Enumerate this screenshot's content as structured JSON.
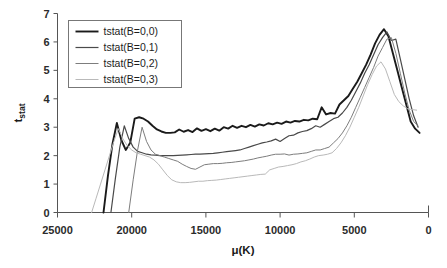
{
  "chart_data": {
    "type": "line",
    "title": "",
    "xlabel": "μ(K)",
    "ylabel": "t",
    "ylabel_sub": "stat",
    "xlim": [
      25000,
      0
    ],
    "ylim": [
      0,
      7
    ],
    "x_reversed": true,
    "grid": false,
    "legend_position": "top-left",
    "xticks": [
      25000,
      20000,
      15000,
      10000,
      5000,
      0
    ],
    "xtick_labels": [
      "25000",
      "20000",
      "15000",
      "10000",
      "5000",
      "0"
    ],
    "yticks": [
      0,
      1,
      2,
      3,
      4,
      5,
      6,
      7
    ],
    "ytick_labels": [
      "0",
      "1",
      "2",
      "3",
      "4",
      "5",
      "6",
      "7"
    ],
    "colors": {
      "series0": "#1a1a1a",
      "series1": "#4a4a4a",
      "series2": "#7d7d7d",
      "series3": "#b9b9b9"
    },
    "series": [
      {
        "name": "tstat(B=0,0)",
        "color": "#1a1a1a",
        "width": 1.9,
        "x": [
          21900,
          21600,
          21300,
          21000,
          20700,
          20400,
          20100,
          19800,
          19500,
          19200,
          18900,
          18600,
          18300,
          18000,
          17700,
          17400,
          17100,
          16800,
          16500,
          16200,
          15900,
          15600,
          15300,
          15000,
          14700,
          14400,
          14100,
          13800,
          13500,
          13200,
          12900,
          12600,
          12300,
          12000,
          11700,
          11400,
          11100,
          10800,
          10500,
          10200,
          9900,
          9600,
          9300,
          9000,
          8700,
          8400,
          8100,
          7800,
          7500,
          7200,
          6900,
          6600,
          6300,
          6000,
          5700,
          5400,
          5100,
          4800,
          4500,
          4200,
          3900,
          3600,
          3300,
          3000,
          2700,
          2400,
          2100,
          1800,
          1500,
          1200,
          900,
          600
        ],
        "y": [
          0.0,
          1.3,
          2.4,
          3.15,
          2.55,
          2.2,
          2.45,
          3.3,
          3.35,
          3.3,
          3.2,
          3.05,
          2.92,
          2.85,
          2.8,
          2.8,
          2.82,
          2.92,
          2.84,
          2.9,
          2.83,
          2.96,
          2.87,
          2.93,
          2.86,
          2.95,
          2.88,
          3.0,
          2.95,
          3.05,
          2.98,
          3.05,
          3.0,
          3.08,
          3.02,
          3.1,
          3.06,
          3.14,
          3.1,
          3.16,
          3.12,
          3.2,
          3.16,
          3.22,
          3.2,
          3.26,
          3.24,
          3.3,
          3.28,
          3.7,
          3.45,
          3.5,
          3.48,
          3.8,
          3.95,
          4.1,
          4.35,
          4.6,
          4.9,
          5.2,
          5.55,
          5.95,
          6.25,
          6.45,
          6.2,
          5.6,
          5.0,
          4.4,
          3.8,
          3.2,
          2.95,
          2.8
        ]
      },
      {
        "name": "tstat(B=0,1)",
        "color": "#4a4a4a",
        "width": 1.2,
        "x": [
          21400,
          21100,
          20800,
          20500,
          20200,
          19900,
          19600,
          19300,
          19000,
          18700,
          18400,
          18100,
          17800,
          17500,
          17200,
          16900,
          16600,
          16300,
          16000,
          15700,
          15400,
          15100,
          14800,
          14500,
          14200,
          13900,
          13600,
          13300,
          13000,
          12700,
          12400,
          12100,
          11800,
          11500,
          11200,
          10900,
          10600,
          10300,
          10000,
          9700,
          9400,
          9100,
          8800,
          8500,
          8200,
          7900,
          7600,
          7300,
          7000,
          6700,
          6400,
          6100,
          5800,
          5500,
          5200,
          4900,
          4600,
          4300,
          4000,
          3700,
          3400,
          3100,
          2800,
          2500,
          2200,
          1900,
          1600,
          1300,
          1000,
          700
        ],
        "y": [
          0.0,
          1.2,
          2.3,
          3.05,
          2.6,
          2.3,
          2.15,
          2.1,
          2.05,
          2.03,
          2.02,
          2.0,
          2.0,
          2.0,
          2.0,
          2.01,
          2.02,
          2.03,
          2.04,
          2.05,
          2.05,
          2.06,
          2.07,
          2.08,
          2.1,
          2.12,
          2.14,
          2.16,
          2.18,
          2.2,
          2.25,
          2.3,
          2.35,
          2.4,
          2.45,
          2.48,
          2.52,
          2.58,
          2.5,
          2.6,
          2.7,
          2.72,
          2.8,
          2.85,
          2.88,
          2.95,
          3.05,
          3.0,
          3.1,
          3.2,
          3.3,
          3.35,
          3.5,
          3.7,
          3.95,
          4.25,
          4.55,
          4.9,
          5.2,
          5.55,
          5.9,
          6.15,
          6.35,
          6.05,
          6.1,
          5.4,
          4.7,
          4.0,
          3.4,
          3.0
        ]
      },
      {
        "name": "tstat(B=0,2)",
        "color": "#7d7d7d",
        "width": 1.0,
        "x": [
          20200,
          19900,
          19600,
          19300,
          19000,
          18700,
          18400,
          18100,
          17800,
          17500,
          17200,
          16900,
          16600,
          16300,
          16000,
          15700,
          15400,
          15100,
          14800,
          14500,
          14200,
          13900,
          13600,
          13300,
          13000,
          12700,
          12400,
          12100,
          11800,
          11500,
          11200,
          10900,
          10600,
          10300,
          10000,
          9700,
          9400,
          9100,
          8800,
          8500,
          8200,
          7900,
          7600,
          7300,
          7000,
          6700,
          6400,
          6100,
          5800,
          5500,
          5200,
          4900,
          4600,
          4300,
          4000,
          3700,
          3400,
          3100,
          2800,
          2500,
          2200,
          1900,
          1600,
          1300,
          1000,
          700
        ],
        "y": [
          0.0,
          1.15,
          2.2,
          3.0,
          2.5,
          2.2,
          2.05,
          2.0,
          1.95,
          1.9,
          1.85,
          1.8,
          1.7,
          1.62,
          1.55,
          1.52,
          1.6,
          1.68,
          1.7,
          1.72,
          1.72,
          1.73,
          1.75,
          1.76,
          1.78,
          1.8,
          1.82,
          1.85,
          1.88,
          1.92,
          1.95,
          1.98,
          2.02,
          2.05,
          2.05,
          2.06,
          2.02,
          2.05,
          2.06,
          2.08,
          2.1,
          2.15,
          2.2,
          2.2,
          2.25,
          2.3,
          2.45,
          2.6,
          2.8,
          3.05,
          3.35,
          3.7,
          4.05,
          4.4,
          4.75,
          5.1,
          5.5,
          5.8,
          6.1,
          6.15,
          5.6,
          4.9,
          4.2,
          3.6,
          3.2,
          3.05
        ]
      },
      {
        "name": "tstat(B=0,3)",
        "color": "#b9b9b9",
        "width": 1.0,
        "x": [
          22700,
          22400,
          22100,
          21800,
          21500,
          21200,
          20900,
          20600,
          20300,
          20000,
          19700,
          19400,
          19100,
          18800,
          18500,
          18200,
          17900,
          17600,
          17300,
          17000,
          16700,
          16400,
          16100,
          15800,
          15500,
          15200,
          14900,
          14600,
          14300,
          14000,
          13700,
          13400,
          13100,
          12800,
          12500,
          12200,
          11900,
          11600,
          11300,
          11000,
          10700,
          10400,
          10100,
          9800,
          9500,
          9200,
          8900,
          8600,
          8300,
          8000,
          7700,
          7400,
          7100,
          6800,
          6500,
          6200,
          5900,
          5600,
          5300,
          5000,
          4700,
          4400,
          4100,
          3800,
          3500,
          3200,
          2900,
          2600,
          2300,
          2000,
          1700,
          1400,
          1100,
          800
        ],
        "y": [
          0.0,
          0.5,
          1.0,
          1.5,
          2.0,
          2.5,
          2.95,
          2.6,
          2.35,
          2.2,
          2.1,
          2.05,
          2.0,
          1.95,
          1.85,
          1.7,
          1.5,
          1.3,
          1.15,
          1.08,
          1.05,
          1.05,
          1.06,
          1.08,
          1.1,
          1.1,
          1.12,
          1.13,
          1.14,
          1.16,
          1.18,
          1.2,
          1.22,
          1.24,
          1.26,
          1.28,
          1.3,
          1.32,
          1.34,
          1.35,
          1.5,
          1.55,
          1.6,
          1.62,
          1.65,
          1.68,
          1.72,
          1.78,
          1.82,
          1.88,
          1.95,
          2.0,
          2.02,
          2.05,
          2.1,
          2.25,
          2.45,
          2.7,
          3.0,
          3.35,
          3.7,
          4.1,
          4.5,
          4.85,
          5.15,
          5.3,
          5.05,
          4.6,
          4.15,
          3.9,
          3.75,
          3.65,
          3.62,
          3.6
        ]
      }
    ]
  },
  "legend": {
    "items": [
      {
        "label": "tstat(B=0,0)"
      },
      {
        "label": "tstat(B=0,1)"
      },
      {
        "label": "tstat(B=0,2)"
      },
      {
        "label": "tstat(B=0,3)"
      }
    ]
  }
}
